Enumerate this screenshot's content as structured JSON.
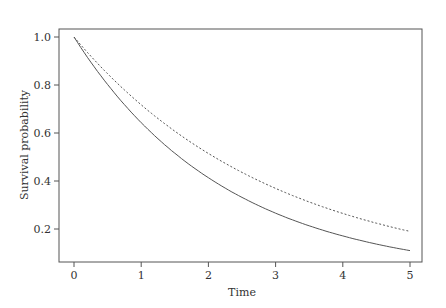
{
  "chart_data": {
    "type": "line",
    "title": "",
    "xlabel": "Time",
    "ylabel": "Survival probability",
    "xlim": [
      -0.15,
      5.15
    ],
    "ylim": [
      0.08,
      1.04
    ],
    "xticks": [
      0,
      1,
      2,
      3,
      4,
      5
    ],
    "yticks": [
      0.2,
      0.4,
      0.6,
      0.8,
      1.0
    ],
    "ytick_labels": [
      "0.2",
      "0.4",
      "0.6",
      "0.8",
      "1.0"
    ],
    "xtick_labels": [
      "0",
      "1",
      "2",
      "3",
      "4",
      "5"
    ],
    "grid": false,
    "legend": null,
    "x": [
      0,
      0.5,
      1,
      1.5,
      2,
      2.5,
      3,
      3.5,
      4,
      4.5,
      5
    ],
    "series": [
      {
        "name": "solid",
        "style": "solid",
        "values": [
          1.0,
          0.8,
          0.64,
          0.51,
          0.41,
          0.32,
          0.26,
          0.21,
          0.17,
          0.13,
          0.11
        ]
      },
      {
        "name": "dashed",
        "style": "dashed",
        "values": [
          1.0,
          0.85,
          0.72,
          0.61,
          0.52,
          0.44,
          0.37,
          0.32,
          0.27,
          0.23,
          0.19
        ]
      }
    ]
  }
}
